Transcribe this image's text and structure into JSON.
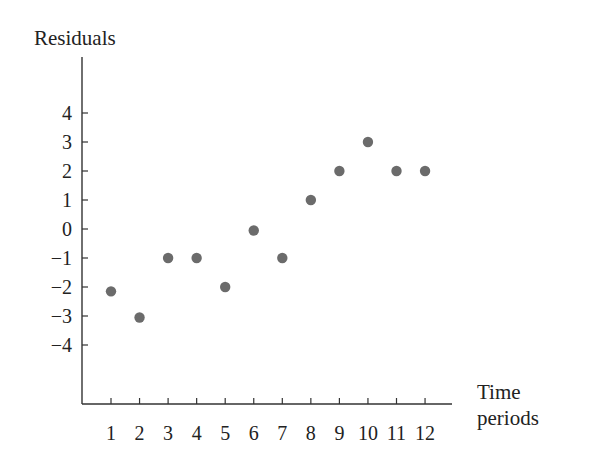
{
  "chart_data": {
    "type": "scatter",
    "title": "",
    "ylabel": "Residuals",
    "xlabel": "Time periods",
    "xlabel_lines": [
      "Time",
      "periods"
    ],
    "x": [
      1,
      2,
      3,
      4,
      5,
      6,
      7,
      8,
      9,
      10,
      11,
      12
    ],
    "y": [
      -2.15,
      -3.05,
      -1,
      -1,
      -2,
      -0.05,
      -1,
      1,
      2,
      3,
      2,
      2
    ],
    "x_ticks": [
      1,
      2,
      3,
      4,
      5,
      6,
      7,
      8,
      9,
      10,
      11,
      12
    ],
    "y_ticks": [
      4,
      3,
      2,
      1,
      0,
      -1,
      -2,
      -3,
      -4
    ],
    "y_tick_labels": [
      "4",
      "3",
      "2",
      "1",
      "0",
      "−1",
      "−2",
      "−3",
      "−4"
    ],
    "xlim": [
      0,
      13
    ],
    "ylim": [
      -6,
      6
    ],
    "grid": false,
    "legend": null,
    "marker_color": "#6b6b6b",
    "axis_color": "#333333"
  }
}
